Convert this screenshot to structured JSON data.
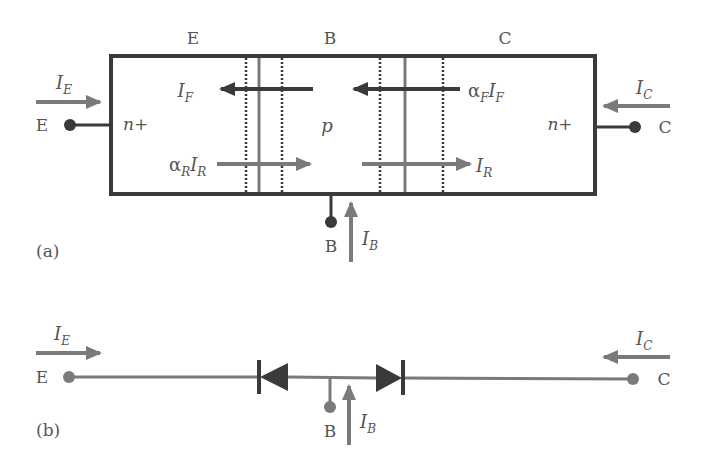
{
  "figure": {
    "colors": {
      "dark": "#3a3a3a",
      "gray": "#7a7a7a",
      "text": "#555555",
      "background": "#ffffff"
    },
    "part_a": {
      "caption": "(a)",
      "region_labels": {
        "emitter": "E",
        "base": "B",
        "collector": "C"
      },
      "doping": {
        "emitter": "n+",
        "base": "p",
        "collector": "n+"
      },
      "terminals": {
        "emitter": "E",
        "base": "B",
        "collector": "C"
      },
      "currents": {
        "emitter": {
          "symbol": "I",
          "sub": "E",
          "direction": "right"
        },
        "collector": {
          "symbol": "I",
          "sub": "C",
          "direction": "left"
        },
        "base": {
          "symbol": "I",
          "sub": "B",
          "direction": "up"
        },
        "forward": {
          "symbol": "I",
          "sub": "F",
          "direction": "left"
        },
        "alpha_f_forward": {
          "prefix": "α",
          "prefix_sub": "F",
          "symbol": "I",
          "sub": "F",
          "direction": "left"
        },
        "alpha_r_reverse": {
          "prefix": "α",
          "prefix_sub": "R",
          "symbol": "I",
          "sub": "R",
          "direction": "right"
        },
        "reverse": {
          "symbol": "I",
          "sub": "R",
          "direction": "right"
        }
      }
    },
    "part_b": {
      "caption": "(b)",
      "terminals": {
        "emitter": "E",
        "base": "B",
        "collector": "C"
      },
      "currents": {
        "emitter": {
          "symbol": "I",
          "sub": "E",
          "direction": "right"
        },
        "collector": {
          "symbol": "I",
          "sub": "C",
          "direction": "left"
        },
        "base": {
          "symbol": "I",
          "sub": "B",
          "direction": "up"
        }
      },
      "diodes": [
        {
          "name": "base-emitter-diode",
          "points": "left"
        },
        {
          "name": "base-collector-diode",
          "points": "right"
        }
      ]
    }
  }
}
